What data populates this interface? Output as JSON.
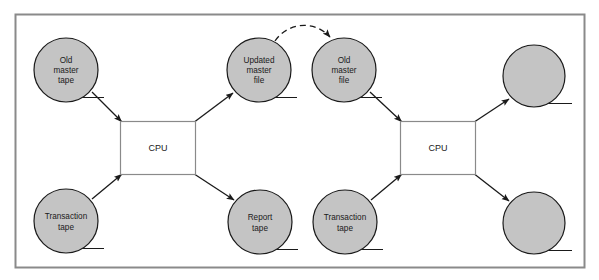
{
  "diagram": {
    "frame": {
      "border_color": "#808080",
      "background_color": "#ffffff"
    },
    "style": {
      "node_fill": "#c4c4c4",
      "node_stroke": "#1a1a1a",
      "process_fill": "#ffffff",
      "process_stroke": "#808080",
      "arrow_color": "#1a1a1a",
      "dashed_arrow_color": "#1a1a1a",
      "text_color": "#1a1a1a"
    },
    "nodes": [
      {
        "id": "old-master-tape",
        "shape": "circle",
        "label_lines": [
          "Old",
          "master",
          "tape"
        ],
        "cx": 66,
        "cy": 70,
        "r": 32
      },
      {
        "id": "transaction-tape-1",
        "shape": "circle",
        "label_lines": [
          "Transaction",
          "tape"
        ],
        "cx": 66,
        "cy": 221,
        "r": 32
      },
      {
        "id": "updated-master-file",
        "shape": "circle",
        "label_lines": [
          "Updated",
          "master",
          "file"
        ],
        "cx": 259,
        "cy": 70,
        "r": 32
      },
      {
        "id": "report-tape",
        "shape": "circle",
        "label_lines": [
          "Report",
          "tape"
        ],
        "cx": 260,
        "cy": 222,
        "r": 32
      },
      {
        "id": "old-master-file",
        "shape": "circle",
        "label_lines": [
          "Old",
          "master",
          "file"
        ],
        "cx": 344,
        "cy": 70,
        "r": 32
      },
      {
        "id": "transaction-tape-2",
        "shape": "circle",
        "label_lines": [
          "Transaction",
          "tape"
        ],
        "cx": 345,
        "cy": 222,
        "r": 32
      },
      {
        "id": "output-master-file",
        "shape": "circle",
        "label_lines": [],
        "cx": 534,
        "cy": 76,
        "r": 31
      },
      {
        "id": "output-report-tape",
        "shape": "circle",
        "label_lines": [],
        "cx": 534,
        "cy": 223,
        "r": 31
      }
    ],
    "processes": [
      {
        "id": "cpu-left",
        "shape": "rect",
        "label": "CPU",
        "x": 120,
        "y": 121,
        "w": 75,
        "h": 54
      },
      {
        "id": "cpu-right",
        "shape": "rect",
        "label": "CPU",
        "x": 400,
        "y": 121,
        "w": 75,
        "h": 54
      }
    ],
    "edges": [
      {
        "id": "edge-old-master-tape-to-cpu-left",
        "from": "old-master-tape",
        "to": "cpu-left",
        "style": "solid"
      },
      {
        "id": "edge-transaction-tape-1-to-cpu-left",
        "from": "transaction-tape-1",
        "to": "cpu-left",
        "style": "solid"
      },
      {
        "id": "edge-cpu-left-to-updated-master-file",
        "from": "cpu-left",
        "to": "updated-master-file",
        "style": "solid"
      },
      {
        "id": "edge-cpu-left-to-report-tape",
        "from": "cpu-left",
        "to": "report-tape",
        "style": "solid"
      },
      {
        "id": "edge-updated-master-file-to-old-master-file",
        "from": "updated-master-file",
        "to": "old-master-file",
        "style": "dashed"
      },
      {
        "id": "edge-old-master-file-to-cpu-right",
        "from": "old-master-file",
        "to": "cpu-right",
        "style": "solid"
      },
      {
        "id": "edge-transaction-tape-2-to-cpu-right",
        "from": "transaction-tape-2",
        "to": "cpu-right",
        "style": "solid"
      },
      {
        "id": "edge-cpu-right-to-output-master-file",
        "from": "cpu-right",
        "to": "output-master-file",
        "style": "solid"
      },
      {
        "id": "edge-cpu-right-to-output-report-tape",
        "from": "cpu-right",
        "to": "output-report-tape",
        "style": "solid"
      }
    ]
  }
}
